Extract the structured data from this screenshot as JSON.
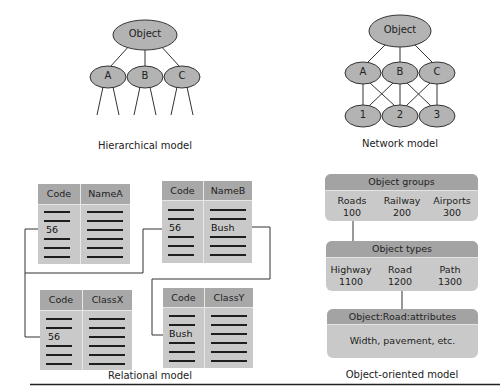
{
  "hierarchical": {
    "caption": "Hierarchical model",
    "root": "Object",
    "children": [
      "A",
      "B",
      "C"
    ]
  },
  "network": {
    "caption": "Network model",
    "root": "Object",
    "level1": [
      "A",
      "B",
      "C"
    ],
    "level2": [
      "1",
      "2",
      "3"
    ]
  },
  "relational": {
    "caption": "Relational model",
    "tables": [
      {
        "headers": [
          "Code",
          "NameA"
        ],
        "key_value": "56",
        "value2": ""
      },
      {
        "headers": [
          "Code",
          "NameB"
        ],
        "key_value": "56",
        "value2": "Bush"
      },
      {
        "headers": [
          "Code",
          "ClassX"
        ],
        "key_value": "56",
        "value2": ""
      },
      {
        "headers": [
          "Code",
          "ClassY"
        ],
        "key_value": "Bush",
        "value2": ""
      }
    ]
  },
  "object_oriented": {
    "caption": "Object-oriented model",
    "groups": {
      "title": "Object groups",
      "items": [
        {
          "name": "Roads",
          "code": "100"
        },
        {
          "name": "Railway",
          "code": "200"
        },
        {
          "name": "Airports",
          "code": "300"
        }
      ]
    },
    "types": {
      "title": "Object types",
      "items": [
        {
          "name": "Highway",
          "code": "1100"
        },
        {
          "name": "Road",
          "code": "1200"
        },
        {
          "name": "Path",
          "code": "1300"
        }
      ]
    },
    "attributes": {
      "title": "Object:Road:attributes",
      "text": "Width, pavement, etc."
    }
  },
  "colors": {
    "node_fill": "#b3b3b3",
    "header_fill": "#a8a8a8",
    "body_fill": "#c9c9c9",
    "line": "#333333"
  }
}
